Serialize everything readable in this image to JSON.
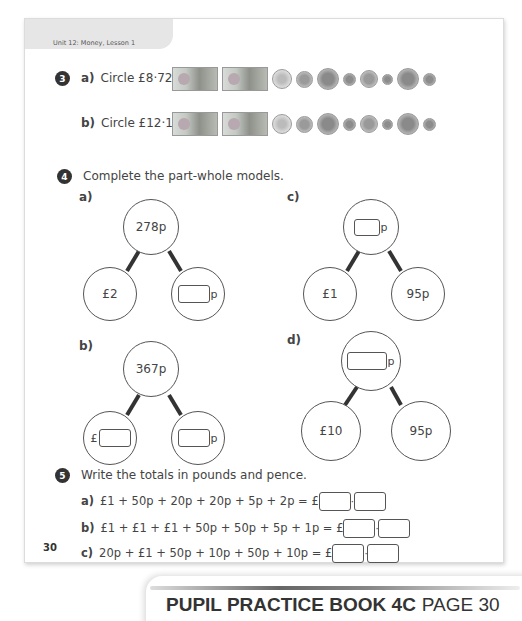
{
  "header": {
    "unit_label": "Unit 12: Money, Lesson 1"
  },
  "question3": {
    "number": "3",
    "parts": [
      {
        "letter": "a)",
        "text": "Circle £8·72."
      },
      {
        "letter": "b)",
        "text": "Circle £12·18."
      }
    ],
    "money_items": [
      "£20 note",
      "£20 note",
      "£2 coin",
      "£1 coin",
      "50p coin",
      "20p coin",
      "10p coin",
      "5p coin",
      "2p coin",
      "1p coin"
    ]
  },
  "question4": {
    "number": "4",
    "instruction": "Complete the part-whole models.",
    "models": [
      {
        "letter": "a)",
        "whole": "278p",
        "part1": "£2",
        "part2_unit": "p"
      },
      {
        "letter": "b)",
        "whole": "367p",
        "part1_unit": "£",
        "part2_unit": "p"
      },
      {
        "letter": "c)",
        "whole_unit": "p",
        "part1": "£1",
        "part2": "95p"
      },
      {
        "letter": "d)",
        "whole_unit": "p",
        "part1": "£10",
        "part2": "95p"
      }
    ]
  },
  "question5": {
    "number": "5",
    "instruction": "Write the totals in pounds and pence.",
    "rows": [
      {
        "letter": "a)",
        "expr": "£1 + 50p + 20p + 20p + 5p + 2p = £"
      },
      {
        "letter": "b)",
        "expr": "£1 + £1 + £1 + 50p + 50p + 5p + 1p = £"
      },
      {
        "letter": "c)",
        "expr": "20p + £1 + 50p + 10p + 50p + 10p = £"
      }
    ],
    "separator": "·"
  },
  "footer": {
    "page_number": "30"
  },
  "banner": {
    "title": "PUPIL PRACTICE BOOK 4C",
    "page": "PAGE 30"
  }
}
